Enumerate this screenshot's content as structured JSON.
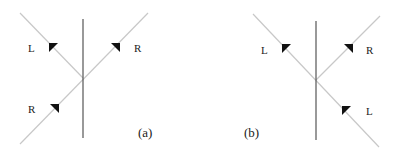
{
  "figure": {
    "panels": [
      {
        "caption": "(a)",
        "labels": {
          "upper_left": "L",
          "upper_right": "R",
          "lower_left": "R"
        }
      },
      {
        "caption": "(b)",
        "labels": {
          "upper_left": "L",
          "upper_right": "R",
          "lower_right": "L"
        }
      }
    ],
    "colors": {
      "ray": "#c8c8c8",
      "axis": "#555555",
      "arrow": "#111111"
    }
  }
}
